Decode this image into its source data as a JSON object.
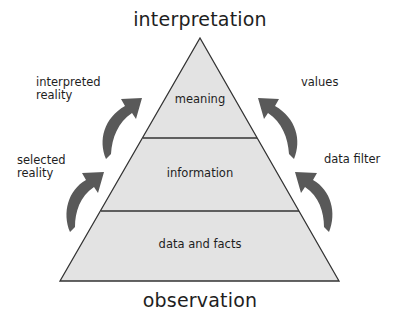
{
  "diagram": {
    "top_label": "interpretation",
    "bottom_label": "observation",
    "levels": [
      {
        "label": "meaning"
      },
      {
        "label": "information"
      },
      {
        "label": "data and facts"
      }
    ],
    "left_annotations": [
      {
        "line1": "interpreted",
        "line2": "reality"
      },
      {
        "line1": "selected",
        "line2": "reality"
      }
    ],
    "right_annotations": [
      {
        "line1": "values"
      },
      {
        "line1": "data filter"
      }
    ],
    "colors": {
      "pyramid_fill": "#e3e3e3",
      "pyramid_stroke": "#333333",
      "arrow_fill": "#595959"
    },
    "icons": {
      "arrows": "curved-up-arrow"
    }
  }
}
